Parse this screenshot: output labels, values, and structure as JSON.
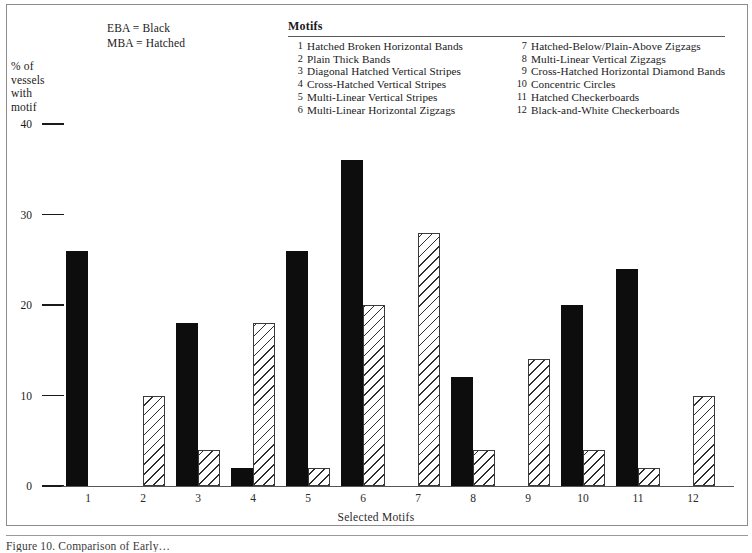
{
  "figure": {
    "caption": "Figure 10. Comparison of Early…"
  },
  "key": {
    "eba": "EBA = Black",
    "mba": "MBA = Hatched"
  },
  "legend": {
    "title": "Motifs",
    "items": [
      {
        "num": "1",
        "label": "Hatched Broken Horizontal Bands"
      },
      {
        "num": "2",
        "label": "Plain Thick Bands"
      },
      {
        "num": "3",
        "label": "Diagonal Hatched Vertical Stripes"
      },
      {
        "num": "4",
        "label": "Cross-Hatched Vertical Stripes"
      },
      {
        "num": "5",
        "label": "Multi-Linear Vertical Stripes"
      },
      {
        "num": "6",
        "label": "Multi-Linear Horizontal Zigzags"
      },
      {
        "num": "7",
        "label": "Hatched-Below/Plain-Above Zigzags"
      },
      {
        "num": "8",
        "label": "Multi-Linear Vertical Zigzags"
      },
      {
        "num": "9",
        "label": "Cross-Hatched Horizontal Diamond Bands"
      },
      {
        "num": "10",
        "label": "Concentric Circles"
      },
      {
        "num": "11",
        "label": "Hatched Checkerboards"
      },
      {
        "num": "12",
        "label": "Black-and-White Checkerboards"
      }
    ]
  },
  "axis": {
    "ylabel_lines": [
      "% of",
      "vessels",
      "with",
      "motif"
    ],
    "xtitle": "Selected Motifs",
    "yticks": [
      "0",
      "10",
      "20",
      "30",
      "40"
    ]
  },
  "chart_data": {
    "type": "bar",
    "title": "",
    "xlabel": "Selected Motifs",
    "ylabel": "% of vessels with motif",
    "categories": [
      "1",
      "2",
      "3",
      "4",
      "5",
      "6",
      "7",
      "8",
      "9",
      "10",
      "11",
      "12"
    ],
    "ylim": [
      0,
      40
    ],
    "yticks": [
      0,
      10,
      20,
      30,
      40
    ],
    "grid": false,
    "legend_position": "top-left",
    "series": [
      {
        "name": "EBA",
        "style": "Black",
        "color": "#0d0d0d",
        "values": [
          26,
          0,
          18,
          2,
          26,
          36,
          0,
          12,
          0,
          20,
          24,
          0
        ]
      },
      {
        "name": "MBA",
        "style": "Hatched",
        "color": "#ffffff",
        "values": [
          0,
          10,
          4,
          18,
          2,
          20,
          28,
          4,
          14,
          4,
          2,
          10
        ]
      }
    ]
  }
}
